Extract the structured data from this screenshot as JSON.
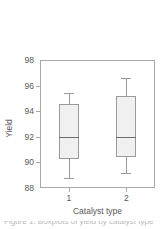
{
  "chart_data": {
    "type": "box",
    "title": "",
    "xlabel": "Catalyst type",
    "ylabel": "Yield",
    "categories": [
      "1",
      "2"
    ],
    "x_tick_labels": [
      "1",
      "2"
    ],
    "y_tick_labels": [
      "88",
      "90",
      "92",
      "94",
      "96",
      "98"
    ],
    "y_ticks": [
      88,
      90,
      92,
      94,
      96,
      98
    ],
    "ylim": [
      88,
      98
    ],
    "grid": false,
    "legend": null,
    "box_fill_color": "#f0f0f0",
    "box_line_color": "#9a9a9c",
    "axis_color": "#a9a9ab",
    "text_color": "#58585a",
    "boxes": [
      {
        "category": "1",
        "whisker_low": 88.8,
        "q1": 90.3,
        "median": 92.0,
        "q3": 94.6,
        "whisker_high": 95.4
      },
      {
        "category": "2",
        "whisker_low": 89.2,
        "q1": 90.4,
        "median": 92.0,
        "q3": 95.2,
        "whisker_high": 96.6
      }
    ]
  },
  "caption": {
    "partial_text": "Figure 1. Boxplots of yield by catalyst type"
  }
}
